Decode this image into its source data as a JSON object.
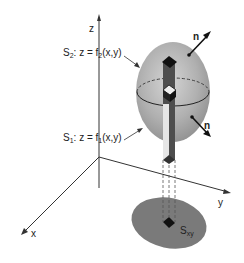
{
  "diagram": {
    "axes": {
      "z_label": "z",
      "x_label": "x",
      "y_label": "y"
    },
    "surfaces": {
      "upper": {
        "name": "S",
        "name_sub": "2",
        "eq_prefix": ": z = f",
        "eq_sub": "2",
        "eq_suffix": "(x,y)"
      },
      "lower": {
        "name": "S",
        "name_sub": "1",
        "eq_prefix": ": z = f",
        "eq_sub": "1",
        "eq_suffix": "(x,y)"
      }
    },
    "normals": {
      "upper_label": "n",
      "lower_label": "n"
    },
    "projection": {
      "name": "S",
      "name_sub": "xy"
    },
    "colors": {
      "solid_fill": "#a8a8a8",
      "solid_light": "#d0d0d0",
      "projection_fill": "#7a7a7a",
      "column_fill": "#555555",
      "ink": "#222222"
    }
  }
}
